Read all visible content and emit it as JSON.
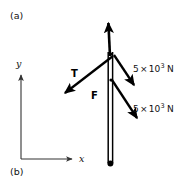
{
  "figure": {
    "type": "free-body-diagram",
    "panels": {
      "top_label": "(a)",
      "bottom_label": "(b)"
    },
    "axes": {
      "x_label": "x",
      "y_label": "y",
      "origin": [
        21,
        159
      ],
      "x_tip": [
        76,
        159
      ],
      "y_tip": [
        21,
        72
      ],
      "color": "#333333"
    },
    "pole": {
      "name": "vertical-pole",
      "top": [
        110,
        52
      ],
      "base": [
        110,
        163
      ],
      "color": "#000000"
    },
    "vectors": [
      {
        "name": "resultant-up",
        "label": "",
        "from": [
          110,
          53
        ],
        "to": [
          108,
          19
        ],
        "color": "#000000"
      },
      {
        "name": "tension-T",
        "label": "T",
        "from": [
          112,
          57
        ],
        "to": [
          62,
          96
        ],
        "color": "#000000"
      },
      {
        "name": "force-upper",
        "label": "5 × 10³ N",
        "from": [
          114,
          55
        ],
        "to": [
          137,
          88
        ],
        "color": "#000000"
      },
      {
        "name": "force-lower",
        "label": "5 × 10³ N",
        "from": [
          112,
          80
        ],
        "to": [
          140,
          122
        ],
        "color": "#000000"
      }
    ],
    "force_labels": {
      "upper": {
        "coefficient": "5",
        "times": "×",
        "base": "10",
        "exponent": "3",
        "unit": "N"
      },
      "lower": {
        "coefficient": "5",
        "times": "×",
        "base": "10",
        "exponent": "3",
        "unit": "N"
      }
    },
    "resultant_label": "F",
    "tension_label": "T",
    "background": "#ffffff"
  }
}
